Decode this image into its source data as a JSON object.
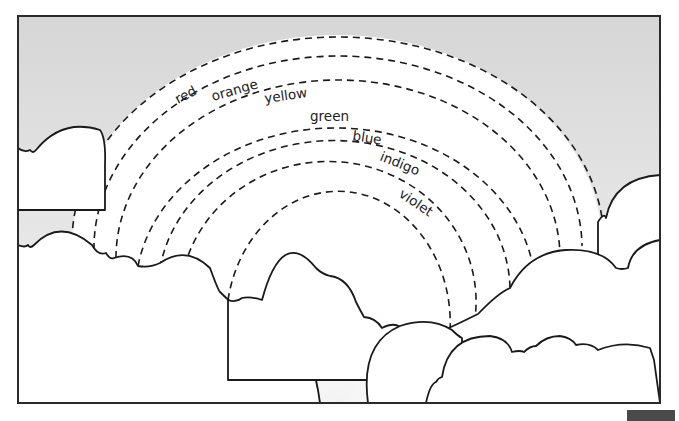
{
  "figure": {
    "colors": {
      "sky_top": "#d6d6d6",
      "sky_bottom": "#f2f2f2",
      "inner_arc_fill": "#ffffff",
      "line": "#1a1a1a",
      "corner_tab": "#4a4a4a"
    },
    "bands": [
      {
        "label": "red"
      },
      {
        "label": "orange"
      },
      {
        "label": "yellow"
      },
      {
        "label": "green"
      },
      {
        "label": "blue"
      },
      {
        "label": "indigo"
      },
      {
        "label": "violet"
      }
    ]
  }
}
